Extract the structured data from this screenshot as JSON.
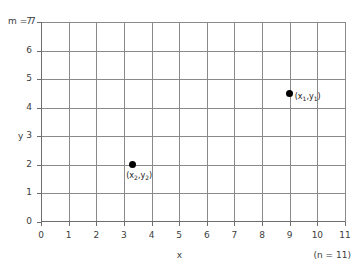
{
  "chart_data": {
    "type": "scatter",
    "title": "",
    "xlabel": "x",
    "ylabel": "y",
    "xlim": [
      0,
      11
    ],
    "ylim": [
      0,
      7
    ],
    "grid": true,
    "legend": null,
    "x_ticks": [
      "0",
      "1",
      "2",
      "3",
      "4",
      "5",
      "6",
      "7",
      "8",
      "9",
      "10",
      "11"
    ],
    "y_ticks": [
      "0",
      "1",
      "2",
      "3",
      "4",
      "5",
      "6",
      "7"
    ],
    "x_tick_values": [
      0,
      1,
      2,
      3,
      4,
      5,
      6,
      7,
      8,
      9,
      10,
      11
    ],
    "y_tick_values": [
      0,
      1,
      2,
      3,
      4,
      5,
      6,
      7
    ],
    "points": [
      {
        "x": 9,
        "y": 4.5,
        "label": "(x₁,y₁)",
        "label_position": "right"
      },
      {
        "x": 3.3,
        "y": 2,
        "label": "(x₂,y₂)",
        "label_position": "below"
      }
    ],
    "annotations": [
      {
        "name": "m-annotation",
        "text": "m = 7"
      },
      {
        "name": "n-annotation",
        "text": "(n = 11)"
      }
    ],
    "colors": {
      "point": "#000000",
      "grid": "#8a8a8a",
      "axis": "#6e6e6e",
      "text": "#3d3d3d",
      "background": "#ffffff"
    }
  },
  "labels": {
    "m_annotation": "m = 7",
    "n_annotation": "(n = 11)",
    "x_axis_title": "x",
    "y_axis_title": "y",
    "point1_label": "(x₁,y₁)",
    "point2_label": "(x₂,y₂)"
  }
}
